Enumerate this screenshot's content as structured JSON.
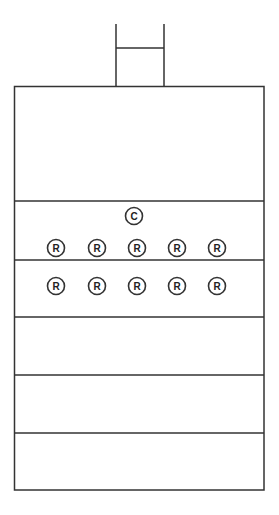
{
  "diagram": {
    "stroke_color": "#333333",
    "background": "#ffffff",
    "chimney": {
      "left_x": 116,
      "right_x": 164,
      "top_y": 24,
      "crossbar_y": 48,
      "bottom_y": 86
    },
    "outer_box": {
      "x": 14,
      "y": 86,
      "width": 250,
      "height": 404
    },
    "divider_lines_y": [
      201,
      260,
      317,
      375,
      433
    ],
    "sections": [
      {
        "name": "top-chamber",
        "y_start": 86,
        "y_end": 201
      },
      {
        "name": "upper-section",
        "y_start": 201,
        "y_end": 260
      },
      {
        "name": "second-section",
        "y_start": 260,
        "y_end": 317
      },
      {
        "name": "third-section",
        "y_start": 317,
        "y_end": 375
      },
      {
        "name": "fourth-section",
        "y_start": 375,
        "y_end": 433
      },
      {
        "name": "bottom-section",
        "y_start": 433,
        "y_end": 490
      }
    ],
    "markers": {
      "c_marker": {
        "label": "C",
        "cx": 134,
        "cy": 216
      },
      "r_row_1": {
        "cy": 248,
        "items": [
          {
            "label": "R",
            "cx": 56
          },
          {
            "label": "R",
            "cx": 97
          },
          {
            "label": "R",
            "cx": 137
          },
          {
            "label": "R",
            "cx": 177
          },
          {
            "label": "R",
            "cx": 217
          }
        ]
      },
      "r_row_2": {
        "cy": 286,
        "items": [
          {
            "label": "R",
            "cx": 56
          },
          {
            "label": "R",
            "cx": 97
          },
          {
            "label": "R",
            "cx": 137
          },
          {
            "label": "R",
            "cx": 177
          },
          {
            "label": "R",
            "cx": 217
          }
        ]
      },
      "radius": 8.5
    }
  }
}
